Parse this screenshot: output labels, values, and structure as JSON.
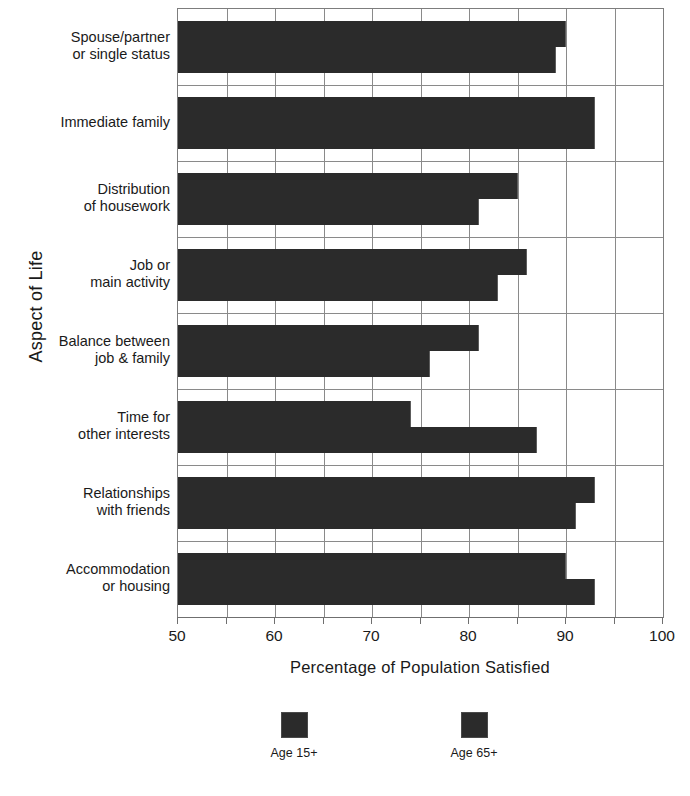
{
  "chart_data": {
    "type": "bar",
    "orientation": "horizontal",
    "title": "",
    "xlabel": "Percentage of Population Satisfied",
    "ylabel": "Aspect of Life",
    "xlim": [
      50,
      100
    ],
    "xticks": [
      50,
      60,
      70,
      80,
      90,
      100
    ],
    "xtick_labels": [
      "50",
      "60",
      "70",
      "80",
      "90",
      "100"
    ],
    "minor_gridlines": [
      55,
      65,
      75,
      85,
      95
    ],
    "grid": true,
    "legend_position": "bottom",
    "bar_color": "#2b2b2b",
    "categories": [
      "Spouse/partner\nor single status",
      "Immediate family",
      "Distribution\nof housework",
      "Job or\nmain activity",
      "Balance between\njob & family",
      "Time for\nother interests",
      "Relationships\nwith friends",
      "Accommodation\nor housing"
    ],
    "series": [
      {
        "name": "Age 15+",
        "values": [
          90,
          93,
          85,
          86,
          81,
          74,
          93,
          90
        ]
      },
      {
        "name": "Age 65+",
        "values": [
          89,
          93,
          81,
          83,
          76,
          87,
          91,
          93
        ]
      }
    ]
  },
  "legend": {
    "items": [
      {
        "label": "Age 15+",
        "color": "#2b2b2b"
      },
      {
        "label": "Age 65+",
        "color": "#2b2b2b"
      }
    ]
  }
}
